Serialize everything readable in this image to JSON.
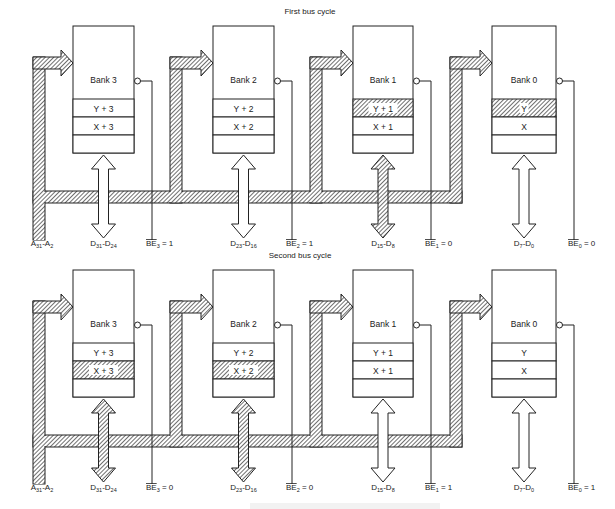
{
  "diagram": {
    "type": "memory-bank-bus-cycles",
    "colors": {
      "ink": "#222222",
      "background": "#ffffff",
      "hatch": "#222222"
    },
    "address_bus_label": {
      "main": "A",
      "sub1": "31",
      "dash": "-",
      "main2": "A",
      "sub2": "2"
    },
    "cycles": [
      {
        "title": "First bus cycle",
        "banks": [
          {
            "name": "Bank 3",
            "cells": [
              "Y + 3",
              "X + 3",
              ""
            ],
            "active_cell": -1,
            "data_active": false,
            "data_label": {
              "a": "D",
              "a_sub": "31",
              "b": "D",
              "b_sub": "24"
            },
            "be": {
              "label": "BE",
              "sub": "3",
              "value": "= 1"
            }
          },
          {
            "name": "Bank 2",
            "cells": [
              "Y + 2",
              "X + 2",
              ""
            ],
            "active_cell": -1,
            "data_active": false,
            "data_label": {
              "a": "D",
              "a_sub": "23",
              "b": "D",
              "b_sub": "16"
            },
            "be": {
              "label": "BE",
              "sub": "2",
              "value": "= 1"
            }
          },
          {
            "name": "Bank 1",
            "cells": [
              "Y + 1",
              "X + 1",
              ""
            ],
            "active_cell": 0,
            "data_active": true,
            "data_label": {
              "a": "D",
              "a_sub": "15",
              "b": "D",
              "b_sub": "8"
            },
            "be": {
              "label": "BE",
              "sub": "1",
              "value": "= 0"
            }
          },
          {
            "name": "Bank 0",
            "cells": [
              "Y",
              "X",
              ""
            ],
            "active_cell": 0,
            "data_active": false,
            "data_label": {
              "a": "D",
              "a_sub": "7",
              "b": "D",
              "b_sub": "0"
            },
            "be": {
              "label": "BE",
              "sub": "0",
              "value": "= 0"
            }
          }
        ]
      },
      {
        "title": "Second bus cycle",
        "banks": [
          {
            "name": "Bank 3",
            "cells": [
              "Y + 3",
              "X + 3",
              ""
            ],
            "active_cell": 1,
            "data_active": true,
            "data_label": {
              "a": "D",
              "a_sub": "31",
              "b": "D",
              "b_sub": "24"
            },
            "be": {
              "label": "BE",
              "sub": "3",
              "value": "= 0"
            }
          },
          {
            "name": "Bank 2",
            "cells": [
              "Y + 2",
              "X + 2",
              ""
            ],
            "active_cell": 1,
            "data_active": true,
            "data_label": {
              "a": "D",
              "a_sub": "23",
              "b": "D",
              "b_sub": "16"
            },
            "be": {
              "label": "BE",
              "sub": "2",
              "value": "= 0"
            }
          },
          {
            "name": "Bank 1",
            "cells": [
              "Y + 1",
              "X + 1",
              ""
            ],
            "active_cell": -1,
            "data_active": false,
            "data_label": {
              "a": "D",
              "a_sub": "15",
              "b": "D",
              "b_sub": "8"
            },
            "be": {
              "label": "BE",
              "sub": "1",
              "value": "= 1"
            }
          },
          {
            "name": "Bank 0",
            "cells": [
              "Y",
              "X",
              ""
            ],
            "active_cell": -1,
            "data_active": false,
            "data_label": {
              "a": "D",
              "a_sub": "7",
              "b": "D",
              "b_sub": "0"
            },
            "be": {
              "label": "BE",
              "sub": "0",
              "value": "= 1"
            }
          }
        ]
      }
    ]
  }
}
